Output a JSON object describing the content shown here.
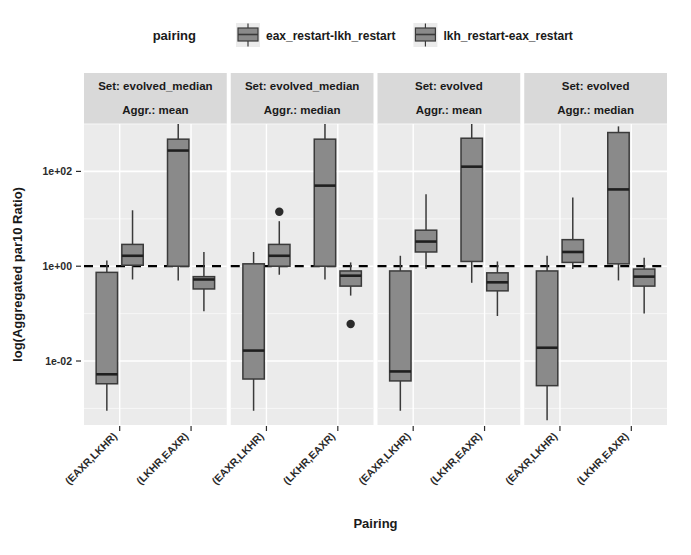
{
  "chart_data": {
    "type": "box",
    "title": "",
    "xlabel": "Pairing",
    "ylabel": "log(Aggregated par10 Ratio)",
    "yscale": "log10",
    "ylim": [
      -3.35,
      3.0
    ],
    "y_ticks": [
      {
        "label": "1e+02",
        "value": 2
      },
      {
        "label": "1e+00",
        "value": 0
      },
      {
        "label": "1e-02",
        "value": -2
      }
    ],
    "grid": true,
    "reference_line": {
      "value": 0,
      "style": "dashed",
      "color": "#000000"
    },
    "legend": {
      "title": "pairing",
      "position": "top",
      "entries": [
        {
          "label": "eax_restart-lkh_restart",
          "color": "#8a8a8a"
        },
        {
          "label": "lkh_restart-eax_restart",
          "color": "#8a8a8a"
        }
      ]
    },
    "categories": [
      "(EAXR,LKHR)",
      "(LKHR,EAXR)"
    ],
    "facets": [
      {
        "strip_lines": [
          "Set: evolved_median",
          "Aggr.: mean"
        ],
        "set": "evolved_median",
        "aggr": "mean",
        "boxes": [
          {
            "category": "(EAXR,LKHR)",
            "pairing": "eax_restart-lkh_restart",
            "whisker_low": -3.05,
            "q1": -2.48,
            "median": -2.28,
            "q3": -0.13,
            "whisker_high": 0.12,
            "outliers": []
          },
          {
            "category": "(EAXR,LKHR)",
            "pairing": "lkh_restart-eax_restart",
            "whisker_low": -0.28,
            "q1": 0.02,
            "median": 0.22,
            "q3": 0.46,
            "whisker_high": 1.18,
            "outliers": []
          },
          {
            "category": "(LKHR,EAXR)",
            "pairing": "eax_restart-lkh_restart",
            "whisker_low": -0.3,
            "q1": 0.0,
            "median": 2.44,
            "q3": 2.68,
            "whisker_high": 3.0,
            "outliers": []
          },
          {
            "category": "(LKHR,EAXR)",
            "pairing": "lkh_restart-eax_restart",
            "whisker_low": -0.95,
            "q1": -0.48,
            "median": -0.28,
            "q3": -0.22,
            "whisker_high": 0.3,
            "outliers": []
          }
        ]
      },
      {
        "strip_lines": [
          "Set: evolved_median",
          "Aggr.: median"
        ],
        "set": "evolved_median",
        "aggr": "median",
        "boxes": [
          {
            "category": "(EAXR,LKHR)",
            "pairing": "eax_restart-lkh_restart",
            "whisker_low": -3.05,
            "q1": -2.38,
            "median": -1.78,
            "q3": 0.05,
            "whisker_high": 0.3,
            "outliers": []
          },
          {
            "category": "(EAXR,LKHR)",
            "pairing": "lkh_restart-eax_restart",
            "whisker_low": -0.18,
            "q1": 0.0,
            "median": 0.22,
            "q3": 0.46,
            "whisker_high": 0.95,
            "outliers": [
              1.15
            ]
          },
          {
            "category": "(LKHR,EAXR)",
            "pairing": "eax_restart-lkh_restart",
            "whisker_low": -0.28,
            "q1": 0.0,
            "median": 1.7,
            "q3": 2.68,
            "whisker_high": 3.0,
            "outliers": []
          },
          {
            "category": "(LKHR,EAXR)",
            "pairing": "lkh_restart-eax_restart",
            "whisker_low": -0.62,
            "q1": -0.42,
            "median": -0.2,
            "q3": -0.1,
            "whisker_high": 0.08,
            "outliers": [
              -1.22
            ]
          }
        ]
      },
      {
        "strip_lines": [
          "Set: evolved",
          "Aggr.: mean"
        ],
        "set": "evolved",
        "aggr": "mean",
        "boxes": [
          {
            "category": "(EAXR,LKHR)",
            "pairing": "eax_restart-lkh_restart",
            "whisker_low": -3.05,
            "q1": -2.42,
            "median": -2.22,
            "q3": -0.1,
            "whisker_high": 0.22,
            "outliers": []
          },
          {
            "category": "(EAXR,LKHR)",
            "pairing": "lkh_restart-eax_restart",
            "whisker_low": -0.06,
            "q1": 0.3,
            "median": 0.52,
            "q3": 0.76,
            "whisker_high": 1.52,
            "outliers": []
          },
          {
            "category": "(LKHR,EAXR)",
            "pairing": "eax_restart-lkh_restart",
            "whisker_low": -0.35,
            "q1": 0.1,
            "median": 2.1,
            "q3": 2.7,
            "whisker_high": 3.0,
            "outliers": []
          },
          {
            "category": "(LKHR,EAXR)",
            "pairing": "lkh_restart-eax_restart",
            "whisker_low": -1.05,
            "q1": -0.52,
            "median": -0.34,
            "q3": -0.14,
            "whisker_high": 0.1,
            "outliers": []
          }
        ]
      },
      {
        "strip_lines": [
          "Set: evolved",
          "Aggr.: median"
        ],
        "set": "evolved",
        "aggr": "median",
        "boxes": [
          {
            "category": "(EAXR,LKHR)",
            "pairing": "eax_restart-lkh_restart",
            "whisker_low": -3.25,
            "q1": -2.52,
            "median": -1.72,
            "q3": -0.1,
            "whisker_high": 0.22,
            "outliers": []
          },
          {
            "category": "(EAXR,LKHR)",
            "pairing": "lkh_restart-eax_restart",
            "whisker_low": -0.06,
            "q1": 0.08,
            "median": 0.3,
            "q3": 0.56,
            "whisker_high": 1.45,
            "outliers": []
          },
          {
            "category": "(LKHR,EAXR)",
            "pairing": "eax_restart-lkh_restart",
            "whisker_low": -0.3,
            "q1": 0.05,
            "median": 1.62,
            "q3": 2.82,
            "whisker_high": 2.95,
            "outliers": []
          },
          {
            "category": "(LKHR,EAXR)",
            "pairing": "lkh_restart-eax_restart",
            "whisker_low": -1.0,
            "q1": -0.42,
            "median": -0.22,
            "q3": -0.06,
            "whisker_high": 0.18,
            "outliers": []
          }
        ]
      }
    ]
  },
  "style": {
    "panel_bg": "#ebebeb",
    "grid_major": "#ffffff",
    "grid_minor": "#f7f7f7",
    "box_fill": "#8a8a8a",
    "box_stroke": "#3a3a3a",
    "strip_bg": "#d9d9d9",
    "text_color": "#1a1a1a"
  }
}
